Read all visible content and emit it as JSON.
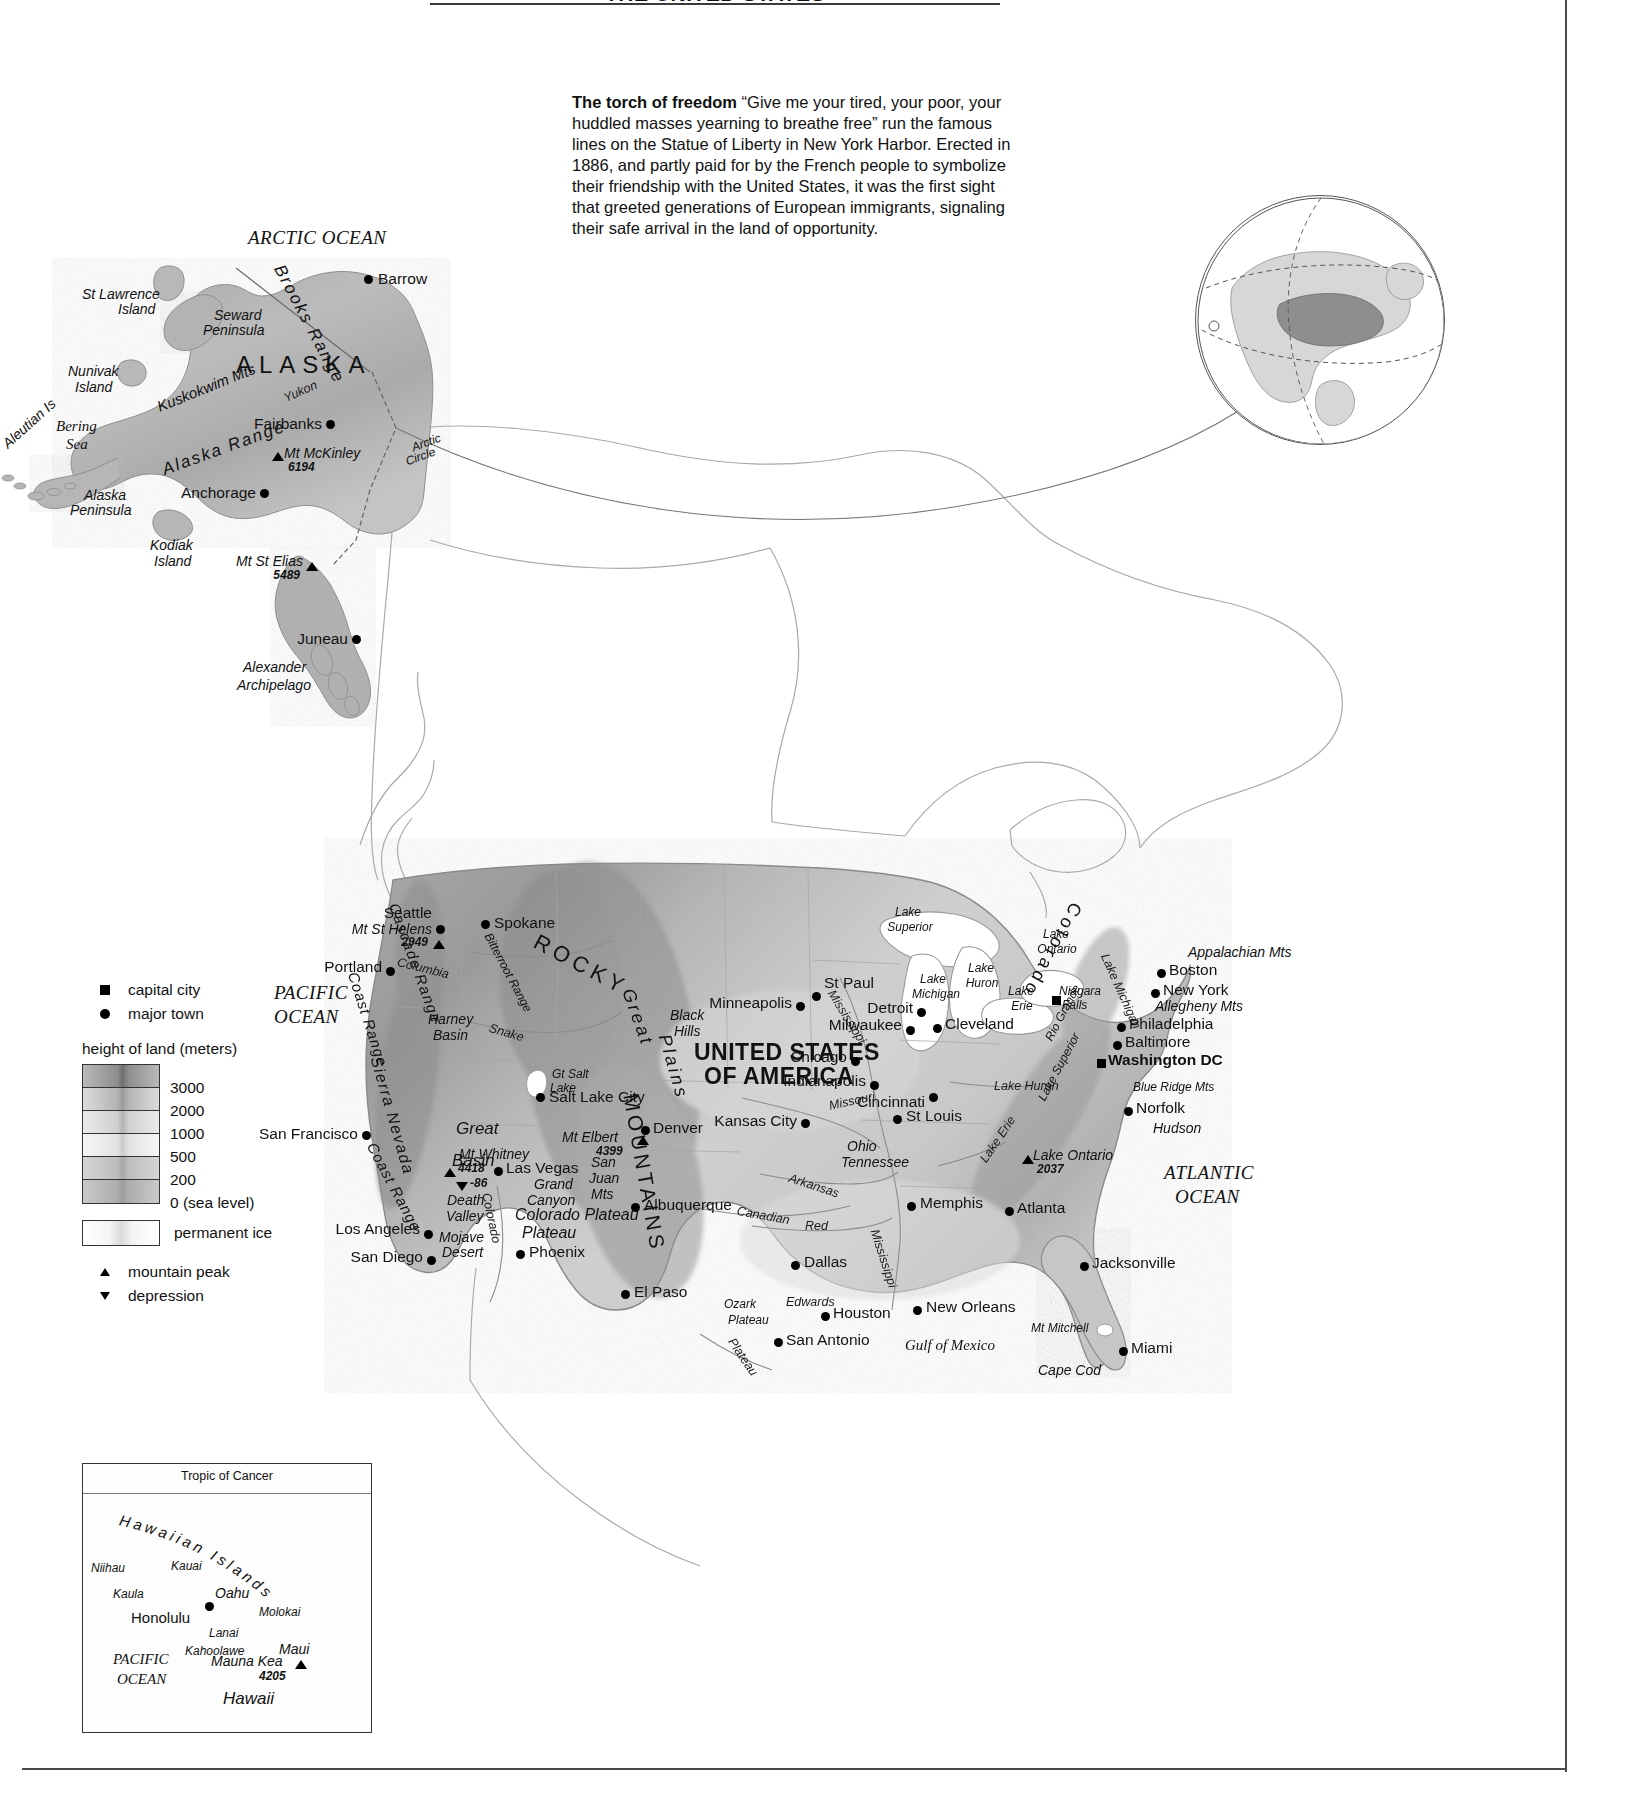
{
  "page": {
    "title": "THE UNITED STATES"
  },
  "intro": {
    "heading": "The torch of freedom",
    "body": "“Give me your tired, your poor, your huddled masses yearning to breathe free” run the famous lines on the Statue of Liberty in New York Harbor. Erected in 1886, and partly paid for by the French people to symbolize their friendship with the United States, it was the first sight that greeted generations of European immigrants, signaling their safe arrival in the land of opportunity."
  },
  "legend": {
    "capital_city": "capital city",
    "major_town": "major town",
    "height_heading": "height of land (meters)",
    "elevations": [
      "3000",
      "2000",
      "1000",
      "500",
      "200",
      "0 (sea level)"
    ],
    "permanent_ice": "permanent ice",
    "mountain_peak": "mountain peak",
    "depression": "depression"
  },
  "map": {
    "country_label": [
      "UNITED STATES",
      "OF AMERICA"
    ],
    "state_label": "ALASKA",
    "oceans": [
      {
        "name": "ARCTIC  OCEAN",
        "x": 248,
        "y": 228
      },
      {
        "name": "PACIFIC",
        "x": 274,
        "y": 983
      },
      {
        "name": "OCEAN",
        "x": 274,
        "y": 1007
      },
      {
        "name": "ATLANTIC",
        "x": 1164,
        "y": 1163
      },
      {
        "name": "OCEAN",
        "x": 1175,
        "y": 1187
      }
    ],
    "seas": [
      {
        "name": "Bering",
        "x": 56,
        "y": 419
      },
      {
        "name": "Sea",
        "x": 66,
        "y": 437
      },
      {
        "name": "Gulf of Mexico",
        "x": 905,
        "y": 1338
      }
    ],
    "capitals": [
      {
        "name": "Washington DC",
        "x": 1108,
        "y": 1057,
        "dx": 8,
        "dy": -8
      }
    ],
    "towns": [
      {
        "name": "Barrow",
        "x": 371,
        "y": 275
      },
      {
        "name": "Fairbanks",
        "x": 330,
        "y": 424
      },
      {
        "name": "Anchorage",
        "x": 263,
        "y": 491
      },
      {
        "name": "Juneau",
        "x": 355,
        "y": 635
      },
      {
        "name": "Seattle",
        "x": 438,
        "y": 908
      },
      {
        "name": "Spokane",
        "x": 487,
        "y": 918
      },
      {
        "name": "Portland",
        "x": 388,
        "y": 960
      },
      {
        "name": "San Francisco",
        "x": 367,
        "y": 1130
      },
      {
        "name": "Los Angeles",
        "x": 427,
        "y": 1227
      },
      {
        "name": "San Diego",
        "x": 430,
        "y": 1254
      },
      {
        "name": "Las Vegas",
        "x": 500,
        "y": 1168
      },
      {
        "name": "Phoenix",
        "x": 521,
        "y": 1248
      },
      {
        "name": "Salt Lake City",
        "x": 541,
        "y": 1097
      },
      {
        "name": "Denver",
        "x": 645,
        "y": 1122
      },
      {
        "name": "Albuquerque",
        "x": 635,
        "y": 1200
      },
      {
        "name": "El Paso",
        "x": 625,
        "y": 1287
      },
      {
        "name": "San Antonio",
        "x": 778,
        "y": 1335
      },
      {
        "name": "Houston",
        "x": 825,
        "y": 1309
      },
      {
        "name": "Dallas",
        "x": 795,
        "y": 1258
      },
      {
        "name": "New Orleans",
        "x": 917,
        "y": 1303
      },
      {
        "name": "Kansas City",
        "x": 806,
        "y": 1117
      },
      {
        "name": "Minneapolis",
        "x": 800,
        "y": 999
      },
      {
        "name": "St Paul",
        "x": 820,
        "y": 978
      },
      {
        "name": "Chicago",
        "x": 855,
        "y": 1052
      },
      {
        "name": "Milwaukee",
        "x": 910,
        "y": 1021
      },
      {
        "name": "Detroit",
        "x": 920,
        "y": 1005
      },
      {
        "name": "Cleveland",
        "x": 938,
        "y": 1019
      },
      {
        "name": "Indianapolis",
        "x": 875,
        "y": 1077
      },
      {
        "name": "Cincinnati",
        "x": 903,
        "y": 1096
      },
      {
        "name": "St Louis",
        "x": 898,
        "y": 1110
      },
      {
        "name": "Memphis",
        "x": 912,
        "y": 1198
      },
      {
        "name": "Atlanta",
        "x": 1012,
        "y": 1203
      },
      {
        "name": "Jacksonville",
        "x": 1085,
        "y": 1259
      },
      {
        "name": "Miami",
        "x": 1128,
        "y": 1344
      },
      {
        "name": "Norfolk",
        "x": 1133,
        "y": 1104
      },
      {
        "name": "Baltimore",
        "x": 1122,
        "y": 1038
      },
      {
        "name": "Philadelphia",
        "x": 1126,
        "y": 1020
      },
      {
        "name": "New York",
        "x": 1160,
        "y": 986
      },
      {
        "name": "Boston",
        "x": 1166,
        "y": 966
      },
      {
        "name": "Niagara Falls",
        "x": 1054,
        "y": 988
      }
    ],
    "physical": [
      {
        "name": "St Lawrence",
        "x": 82,
        "y": 287
      },
      {
        "name": "Island",
        "x": 118,
        "y": 302
      },
      {
        "name": "Nunivak",
        "x": 68,
        "y": 364
      },
      {
        "name": "Island",
        "x": 75,
        "y": 380
      },
      {
        "name": "Aleutian Is",
        "x": 0,
        "y": 440
      },
      {
        "name": "Alaska",
        "x": 84,
        "y": 488
      },
      {
        "name": "Peninsula",
        "x": 70,
        "y": 503
      },
      {
        "name": "Kodiak",
        "x": 150,
        "y": 538
      },
      {
        "name": "Island",
        "x": 154,
        "y": 554
      },
      {
        "name": "Seward",
        "x": 214,
        "y": 308
      },
      {
        "name": "Peninsula",
        "x": 203,
        "y": 323
      },
      {
        "name": "Brooks Range",
        "x": 290,
        "y": 270
      },
      {
        "name": "Kuskokwim Mts",
        "x": 155,
        "y": 400
      },
      {
        "name": "Alaska Range",
        "x": 160,
        "y": 462
      },
      {
        "name": "Yukon",
        "x": 282,
        "y": 393
      },
      {
        "name": "Arctic",
        "x": 410,
        "y": 442
      },
      {
        "name": "Circle",
        "x": 404,
        "y": 456
      },
      {
        "name": "Mt McKinley",
        "x": 283,
        "y": 450
      },
      {
        "name": "Mt St Elias",
        "x": 239,
        "y": 556
      },
      {
        "name": "Alexander",
        "x": 243,
        "y": 660
      },
      {
        "name": "Archipelago",
        "x": 237,
        "y": 678
      },
      {
        "name": "Mt St Helens",
        "x": 330,
        "y": 921
      },
      {
        "name": "Cascade Range",
        "x": 400,
        "y": 905
      },
      {
        "name": "Coast Range",
        "x": 357,
        "y": 975
      },
      {
        "name": "Columbia",
        "x": 404,
        "y": 953
      },
      {
        "name": "Bitterroot Range",
        "x": 492,
        "y": 935
      },
      {
        "name": "Harney",
        "x": 430,
        "y": 1015
      },
      {
        "name": "Basin",
        "x": 435,
        "y": 1031
      },
      {
        "name": "Snake",
        "x": 493,
        "y": 1025
      },
      {
        "name": "ROCKY",
        "x": 545,
        "y": 940
      },
      {
        "name": "Sierra Nevada",
        "x": 382,
        "y": 1065
      },
      {
        "name": "Great",
        "x": 457,
        "y": 1125
      },
      {
        "name": "Basin",
        "x": 454,
        "y": 1155
      },
      {
        "name": "Gt Salt",
        "x": 552,
        "y": 1070
      },
      {
        "name": "Lake",
        "x": 552,
        "y": 1084
      },
      {
        "name": "Mt Whitney",
        "x": 460,
        "y": 1150
      },
      {
        "name": "Death",
        "x": 448,
        "y": 1195
      },
      {
        "name": "Valley",
        "x": 447,
        "y": 1211
      },
      {
        "name": "Mojave",
        "x": 440,
        "y": 1232
      },
      {
        "name": "Desert",
        "x": 443,
        "y": 1247
      },
      {
        "name": "Grand",
        "x": 535,
        "y": 1180
      },
      {
        "name": "Canyon",
        "x": 528,
        "y": 1196
      },
      {
        "name": "Colorado Plateau",
        "x": 518,
        "y": 1211
      },
      {
        "name": "Plateau",
        "x": 524,
        "y": 1228
      },
      {
        "name": "Colorado",
        "x": 492,
        "y": 1195
      },
      {
        "name": "Mt Elbert",
        "x": 563,
        "y": 1134
      },
      {
        "name": "San",
        "x": 592,
        "y": 1158
      },
      {
        "name": "Juan",
        "x": 590,
        "y": 1174
      },
      {
        "name": "Mts",
        "x": 592,
        "y": 1190
      },
      {
        "name": "Great",
        "x": 640,
        "y": 990
      },
      {
        "name": "Plains",
        "x": 660,
        "y": 1030
      },
      {
        "name": "Black",
        "x": 672,
        "y": 1012
      },
      {
        "name": "Hills",
        "x": 676,
        "y": 1028
      },
      {
        "name": "MOUNTAINS",
        "x": 650,
        "y": 1100
      },
      {
        "name": "Canadian",
        "x": 741,
        "y": 1208
      },
      {
        "name": "Arkansas",
        "x": 795,
        "y": 1175
      },
      {
        "name": "Red",
        "x": 807,
        "y": 1223
      },
      {
        "name": "Missouri",
        "x": 833,
        "y": 1103
      },
      {
        "name": "Mississippi",
        "x": 840,
        "y": 990
      },
      {
        "name": "Mississippi",
        "x": 882,
        "y": 1230
      },
      {
        "name": "Ohio",
        "x": 997,
        "y": 1083
      },
      {
        "name": "Tennessee",
        "x": 982,
        "y": 1160
      },
      {
        "name": "Ozark",
        "x": 850,
        "y": 1143
      },
      {
        "name": "Plateau",
        "x": 843,
        "y": 1159
      },
      {
        "name": "Edwards",
        "x": 727,
        "y": 1301
      },
      {
        "name": "Plateau",
        "x": 731,
        "y": 1317
      },
      {
        "name": "Colorado",
        "x": 786,
        "y": 1299
      },
      {
        "name": "Rio Grande",
        "x": 737,
        "y": 1340
      },
      {
        "name": "Lake Superior",
        "x": 892,
        "y": 908
      },
      {
        "name": "Lake Michigan",
        "x": 915,
        "y": 975
      },
      {
        "name": "Lake Huron",
        "x": 968,
        "y": 965
      },
      {
        "name": "Lake Erie",
        "x": 1010,
        "y": 985
      },
      {
        "name": "Lake Ontario",
        "x": 1038,
        "y": 930
      },
      {
        "name": "Appalachian Mts",
        "x": 1055,
        "y": 1050
      },
      {
        "name": "Allegheny Mts",
        "x": 1047,
        "y": 1040
      },
      {
        "name": "Blue Ridge Mts",
        "x": 1048,
        "y": 1090
      },
      {
        "name": "Hudson",
        "x": 1114,
        "y": 955
      },
      {
        "name": "Mt Mitchell",
        "x": 1032,
        "y": 1150
      },
      {
        "name": "Cape Cod",
        "x": 1188,
        "y": 949
      },
      {
        "name": "Long Island",
        "x": 1155,
        "y": 1003
      },
      {
        "name": "Chesapeake Bay",
        "x": 1133,
        "y": 1086
      },
      {
        "name": "Cape Hatteras",
        "x": 1153,
        "y": 1124
      },
      {
        "name": "L Okeechobee",
        "x": 1031,
        "y": 1326
      },
      {
        "name": "Cape Sable",
        "x": 1038,
        "y": 1366
      }
    ],
    "elevations": [
      {
        "peak": "Mt McKinley",
        "value": "6194"
      },
      {
        "peak": "Mt St Elias",
        "value": "5489"
      },
      {
        "peak": "Mt St Helens",
        "value": "2949"
      },
      {
        "peak": "Mt Whitney",
        "value": "4418"
      },
      {
        "peak": "Death Valley",
        "value": "-86"
      },
      {
        "peak": "Mt Elbert",
        "value": "4399"
      },
      {
        "peak": "Mt Mitchell",
        "value": "2037"
      },
      {
        "peak": "Mauna Kea",
        "value": "4205"
      }
    ]
  },
  "hawaii": {
    "tropic_label": "Tropic of Cancer",
    "arc_label": "Hawaiian Islands",
    "ocean": [
      "PACIFIC",
      "OCEAN"
    ],
    "islands": [
      {
        "name": "Niihau",
        "x": 12,
        "y": 106
      },
      {
        "name": "Kauai",
        "x": 85,
        "y": 104
      },
      {
        "name": "Kaula",
        "x": 30,
        "y": 133
      },
      {
        "name": "Oahu",
        "x": 125,
        "y": 135
      },
      {
        "name": "Molokai",
        "x": 178,
        "y": 152
      },
      {
        "name": "Lanai",
        "x": 140,
        "y": 172
      },
      {
        "name": "Kahoolawe",
        "x": 115,
        "y": 190
      },
      {
        "name": "Maui",
        "x": 202,
        "y": 180
      },
      {
        "name": "Hawaii",
        "x": 145,
        "y": 233
      }
    ],
    "city": "Honolulu",
    "peak": "Mauna Kea",
    "peak_elev": "4205"
  }
}
